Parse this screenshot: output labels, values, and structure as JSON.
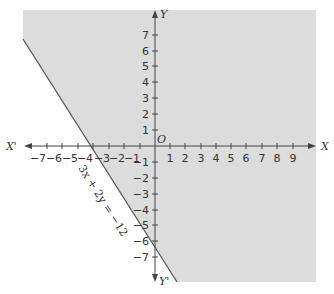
{
  "diagram": {
    "type": "linear-inequality-graph",
    "shade_color": "#dcdcdc",
    "axis_color": "#444444",
    "line_color": "#555555",
    "background": "#ffffff",
    "axes": {
      "x_positive_label": "X",
      "x_negative_label": "X'",
      "y_positive_label": "Y",
      "y_negative_label": "Y'",
      "origin_label": "O"
    },
    "x_ticks": [
      "-7",
      "-6",
      "-5",
      "-4",
      "-3",
      "-2",
      "-1",
      "1",
      "2",
      "3",
      "4",
      "5",
      "6",
      "7",
      "8",
      "9"
    ],
    "y_ticks_positive": [
      "7",
      "6",
      "5",
      "4",
      "3",
      "2",
      "1"
    ],
    "y_ticks_negative": [
      "-1",
      "-2",
      "-3",
      "-4",
      "-5",
      "-6",
      "-7"
    ],
    "line": {
      "equation": "3x + 2y = −12",
      "x_intercept": -4,
      "y_intercept": -6
    },
    "shaded_region": "3x + 2y ≥ −12 (side containing origin)"
  }
}
